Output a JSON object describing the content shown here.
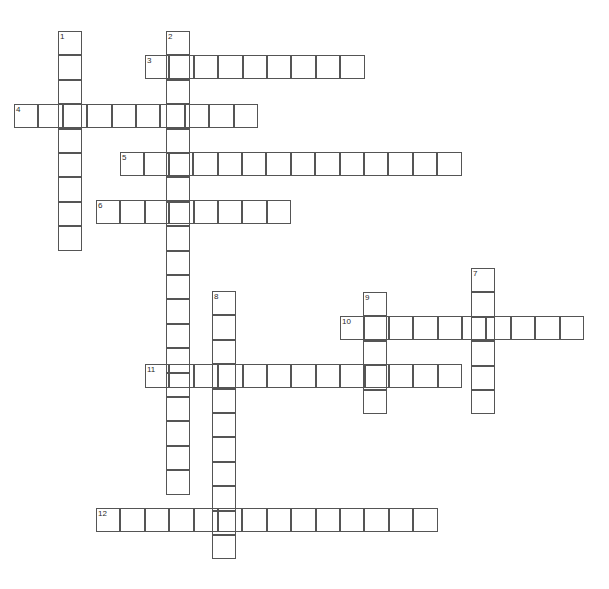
{
  "puzzle": {
    "title": "Crossword Puzzle Grid",
    "type": "crossword-grid",
    "width_px": 609,
    "height_px": 589,
    "cell_size_px": 24.4,
    "origin_x_px": 14,
    "origin_y_px": 31,
    "grid_line_color": "#555555",
    "cell_fill_color": "#ffffff",
    "background_color": "#ffffff",
    "number_color": "#2b2b2b",
    "total_entries": 12,
    "across_count": 6,
    "down_count": 6
  },
  "entries": [
    {
      "number": "1",
      "direction": "down",
      "length": 9,
      "start_col": 2,
      "start_row": 0,
      "x": 58,
      "y": 31,
      "cells": [
        "",
        "",
        "",
        "",
        "",
        "",
        "",
        "",
        ""
      ]
    },
    {
      "number": "2",
      "direction": "down",
      "length": 19,
      "start_col": 6,
      "start_row": 0,
      "x": 166,
      "y": 31,
      "cells": [
        "",
        "",
        "",
        "",
        "",
        "",
        "",
        "",
        "",
        "",
        "",
        "",
        "",
        "",
        "",
        "",
        "",
        "",
        ""
      ]
    },
    {
      "number": "3",
      "direction": "across",
      "length": 9,
      "start_col": 5,
      "start_row": 1,
      "x": 145,
      "y": 55,
      "cells": [
        "",
        "",
        "",
        "",
        "",
        "",
        "",
        "",
        ""
      ]
    },
    {
      "number": "4",
      "direction": "across",
      "length": 10,
      "start_col": 0,
      "start_row": 3,
      "x": 14,
      "y": 104,
      "cells": [
        "",
        "",
        "",
        "",
        "",
        "",
        "",
        "",
        "",
        ""
      ]
    },
    {
      "number": "5",
      "direction": "across",
      "length": 14,
      "start_col": 4,
      "start_row": 5,
      "x": 120,
      "y": 152,
      "cells": [
        "",
        "",
        "",
        "",
        "",
        "",
        "",
        "",
        "",
        "",
        "",
        "",
        "",
        ""
      ]
    },
    {
      "number": "6",
      "direction": "across",
      "length": 8,
      "start_col": 3,
      "start_row": 7,
      "x": 96,
      "y": 200,
      "cells": [
        "",
        "",
        "",
        "",
        "",
        "",
        "",
        ""
      ]
    },
    {
      "number": "7",
      "direction": "down",
      "length": 6,
      "start_col": 19,
      "start_row": 9,
      "x": 471,
      "y": 268,
      "cells": [
        "",
        "",
        "",
        "",
        "",
        ""
      ]
    },
    {
      "number": "8",
      "direction": "down",
      "length": 11,
      "start_col": 8,
      "start_row": 10,
      "x": 212,
      "y": 291,
      "cells": [
        "",
        "",
        "",
        "",
        "",
        "",
        "",
        "",
        "",
        "",
        ""
      ]
    },
    {
      "number": "9",
      "direction": "down",
      "length": 5,
      "start_col": 14,
      "start_row": 10,
      "x": 363,
      "y": 292,
      "cells": [
        "",
        "",
        "",
        "",
        ""
      ]
    },
    {
      "number": "10",
      "direction": "across",
      "length": 10,
      "start_col": 13,
      "start_row": 12,
      "x": 340,
      "y": 316,
      "cells": [
        "",
        "",
        "",
        "",
        "",
        "",
        "",
        "",
        "",
        ""
      ]
    },
    {
      "number": "11",
      "direction": "across",
      "length": 13,
      "start_col": 5,
      "start_row": 14,
      "x": 145,
      "y": 364,
      "cells": [
        "",
        "",
        "",
        "",
        "",
        "",
        "",
        "",
        "",
        "",
        "",
        "",
        ""
      ]
    },
    {
      "number": "12",
      "direction": "across",
      "length": 14,
      "start_col": 3,
      "start_row": 20,
      "x": 96,
      "y": 508,
      "cells": [
        "",
        "",
        "",
        "",
        "",
        "",
        "",
        "",
        "",
        "",
        "",
        "",
        "",
        ""
      ]
    }
  ]
}
